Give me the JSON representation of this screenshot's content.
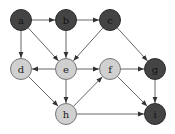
{
  "diagram": {
    "type": "directed-graph",
    "colors": {
      "dark_fill": "#444444",
      "dark_stroke": "#2a2a2a",
      "light_fill": "#d0d0d0",
      "light_stroke": "#777777",
      "edge": "#666666",
      "dark_label": "#111111",
      "light_label": "#222222"
    },
    "node_radius": 10.5,
    "nodes": [
      {
        "id": "a",
        "label": "a",
        "x": 21,
        "y": 20,
        "shade": "dark"
      },
      {
        "id": "b",
        "label": "b",
        "x": 66,
        "y": 20,
        "shade": "dark"
      },
      {
        "id": "c",
        "label": "c",
        "x": 110,
        "y": 20,
        "shade": "dark"
      },
      {
        "id": "d",
        "label": "d",
        "x": 21,
        "y": 69,
        "shade": "light"
      },
      {
        "id": "e",
        "label": "e",
        "x": 66,
        "y": 69,
        "shade": "light"
      },
      {
        "id": "f",
        "label": "f",
        "x": 110,
        "y": 69,
        "shade": "light"
      },
      {
        "id": "g",
        "label": "g",
        "x": 155,
        "y": 69,
        "shade": "dark"
      },
      {
        "id": "h",
        "label": "h",
        "x": 66,
        "y": 114,
        "shade": "light"
      },
      {
        "id": "i",
        "label": "i",
        "x": 155,
        "y": 114,
        "shade": "dark"
      }
    ],
    "edges": [
      {
        "from": "a",
        "to": "b"
      },
      {
        "from": "a",
        "to": "d"
      },
      {
        "from": "a",
        "to": "e"
      },
      {
        "from": "b",
        "to": "c"
      },
      {
        "from": "b",
        "to": "e"
      },
      {
        "from": "c",
        "to": "e"
      },
      {
        "from": "c",
        "to": "g"
      },
      {
        "from": "e",
        "to": "d"
      },
      {
        "from": "e",
        "to": "f"
      },
      {
        "from": "e",
        "to": "h"
      },
      {
        "from": "d",
        "to": "h"
      },
      {
        "from": "f",
        "to": "g"
      },
      {
        "from": "f",
        "to": "i"
      },
      {
        "from": "h",
        "to": "f"
      },
      {
        "from": "h",
        "to": "i"
      },
      {
        "from": "g",
        "to": "i"
      }
    ]
  }
}
